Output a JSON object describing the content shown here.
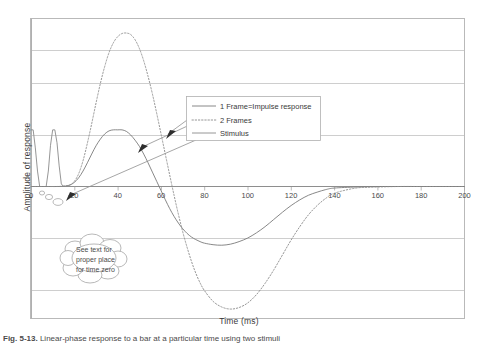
{
  "figure": {
    "caption_label": "Fig. 5-13.",
    "caption_text": "Linear-phase response to a bar at a particular time using two stimuli"
  },
  "chart_data": {
    "type": "line",
    "title": "",
    "xlabel": "Time (ms)",
    "ylabel": "Amplitude of response",
    "xlim": [
      0,
      200
    ],
    "ylim": [
      -2.6,
      3.2
    ],
    "xticks": [
      0,
      20,
      40,
      60,
      80,
      100,
      120,
      140,
      160,
      180,
      200
    ],
    "yticks": [
      -2,
      -1,
      0,
      1,
      2,
      3
    ],
    "grid": "horizontal",
    "legend_position": "upper-center",
    "series": [
      {
        "name": "1 Frame=Impulse response",
        "style": "solid",
        "color": "#7a7a7a",
        "x": [
          0,
          2,
          4,
          6,
          8,
          10,
          12,
          14,
          16,
          18,
          20,
          22,
          24,
          26,
          28,
          30,
          32,
          34,
          36,
          38,
          40,
          42,
          44,
          46,
          48,
          50,
          52,
          54,
          56,
          58,
          60,
          62,
          64,
          66,
          68,
          70,
          72,
          74,
          76,
          78,
          80,
          84,
          88,
          92,
          96,
          100,
          104,
          108,
          112,
          116,
          120,
          124,
          128,
          132,
          136,
          140,
          150,
          160,
          170,
          180,
          190,
          200
        ],
        "y": [
          0,
          0,
          0,
          0,
          0,
          0,
          0,
          0,
          0.01,
          0.03,
          0.08,
          0.17,
          0.3,
          0.46,
          0.63,
          0.79,
          0.92,
          1.02,
          1.08,
          1.1,
          1.1,
          1.1,
          1.07,
          1.0,
          0.9,
          0.78,
          0.63,
          0.46,
          0.28,
          0.1,
          -0.08,
          -0.26,
          -0.43,
          -0.58,
          -0.71,
          -0.82,
          -0.91,
          -0.98,
          -1.03,
          -1.07,
          -1.1,
          -1.13,
          -1.14,
          -1.12,
          -1.07,
          -1.0,
          -0.9,
          -0.78,
          -0.64,
          -0.5,
          -0.37,
          -0.26,
          -0.17,
          -0.11,
          -0.06,
          -0.03,
          -0.01,
          0,
          0,
          0,
          0,
          0
        ]
      },
      {
        "name": "2 Frames",
        "style": "dotted",
        "color": "#8a8a8a",
        "x": [
          0,
          4,
          8,
          12,
          16,
          18,
          20,
          22,
          24,
          26,
          28,
          30,
          32,
          34,
          36,
          38,
          40,
          42,
          44,
          46,
          48,
          50,
          52,
          54,
          56,
          58,
          60,
          62,
          64,
          66,
          68,
          70,
          72,
          74,
          76,
          78,
          80,
          84,
          88,
          92,
          96,
          100,
          104,
          108,
          112,
          116,
          120,
          124,
          128,
          132,
          136,
          140,
          150,
          160,
          170,
          180,
          190,
          200
        ],
        "y": [
          0,
          0,
          0,
          0,
          0.01,
          0.03,
          0.1,
          0.25,
          0.5,
          0.84,
          1.22,
          1.62,
          2.0,
          2.33,
          2.6,
          2.79,
          2.91,
          2.97,
          2.98,
          2.95,
          2.85,
          2.68,
          2.44,
          2.14,
          1.8,
          1.42,
          1.02,
          0.62,
          0.22,
          -0.17,
          -0.54,
          -0.88,
          -1.18,
          -1.45,
          -1.68,
          -1.87,
          -2.02,
          -2.23,
          -2.34,
          -2.38,
          -2.35,
          -2.26,
          -2.1,
          -1.88,
          -1.62,
          -1.33,
          -1.04,
          -0.78,
          -0.55,
          -0.37,
          -0.23,
          -0.13,
          -0.03,
          -0.01,
          0,
          0,
          0,
          0
        ]
      },
      {
        "name": "Stimulus",
        "style": "solid",
        "color": "#8a8a8a",
        "x": [
          0,
          1,
          2,
          3,
          4,
          5,
          6,
          7,
          8,
          9,
          10,
          11,
          12,
          13,
          14,
          15,
          16,
          17,
          18,
          20,
          200
        ],
        "y": [
          1.1,
          1.1,
          0.75,
          0.3,
          0,
          0,
          0,
          0,
          0.3,
          0.8,
          1.1,
          1.1,
          0.85,
          0.4,
          0.05,
          0,
          0,
          0,
          0,
          0,
          0
        ]
      }
    ],
    "annotations": [
      {
        "name": "time-zero-bubble",
        "kind": "thought-bubble",
        "lines": [
          "See text for",
          "proper place",
          "for time zero"
        ]
      },
      {
        "name": "leader-arrow-stimulus",
        "kind": "arrow",
        "points_to": "Stimulus"
      },
      {
        "name": "leader-arrow-one-frame",
        "kind": "arrow",
        "points_to": "1 Frame=Impulse response"
      },
      {
        "name": "leader-arrow-two-frames",
        "kind": "arrow",
        "points_to": "2 Frames"
      }
    ]
  }
}
